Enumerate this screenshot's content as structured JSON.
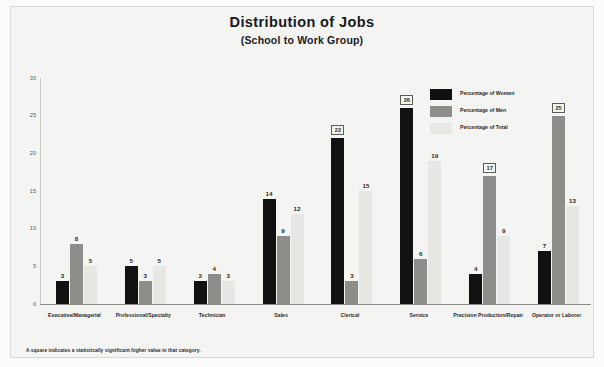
{
  "chart_data": {
    "type": "bar",
    "title": "Distribution of Jobs",
    "subtitle": "(School to Work Group)",
    "xlabel": "",
    "ylabel": "",
    "ylim": [
      0,
      30
    ],
    "yticks": [
      0,
      5,
      10,
      15,
      20,
      25,
      30
    ],
    "grid": false,
    "legend_position": "upper right",
    "categories": [
      "Executive/Managerial",
      "Professional/Specialty",
      "Technician",
      "Sales",
      "Clerical",
      "Service",
      "Precision Production/Repair",
      "Operator or Laborer"
    ],
    "series": [
      {
        "name": "Percentage of Women",
        "color": "#111111",
        "values": [
          3,
          5,
          3,
          14,
          22,
          26,
          4,
          7
        ],
        "significant": [
          false,
          false,
          false,
          false,
          true,
          true,
          false,
          false
        ]
      },
      {
        "name": "Percentage of Men",
        "color": "#8d8d8a",
        "values": [
          8,
          3,
          4,
          9,
          3,
          6,
          17,
          25
        ],
        "significant": [
          false,
          false,
          false,
          false,
          false,
          false,
          true,
          true
        ]
      },
      {
        "name": "Percentage of Total",
        "color": "#e7e7e3",
        "values": [
          5,
          5,
          3,
          12,
          15,
          19,
          9,
          13
        ],
        "significant": [
          false,
          false,
          false,
          false,
          false,
          false,
          false,
          false
        ]
      }
    ],
    "footnote": "A square indicates a statistically significant higher value in that category."
  }
}
